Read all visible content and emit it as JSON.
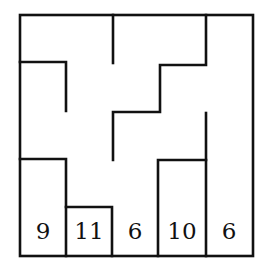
{
  "puzzle": {
    "type": "maze-region-grid",
    "grid": {
      "rows": 5,
      "cols": 5
    },
    "colors": {
      "line": "#111111",
      "background": "#ffffff"
    },
    "bottom_row_numbers": [
      "9",
      "11",
      "6",
      "10",
      "6"
    ]
  }
}
